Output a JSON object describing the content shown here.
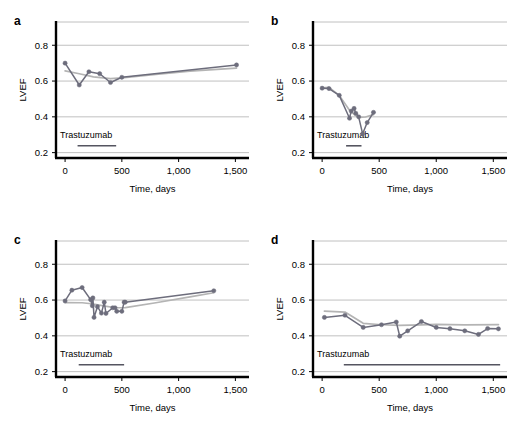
{
  "figure": {
    "panel_count": 4,
    "axis": {
      "ylabel": "LVEF",
      "xlabel": "Time, days",
      "yticks": [
        "0.2",
        "0.4",
        "0.6",
        "0.8"
      ],
      "ytick_values": [
        0.2,
        0.4,
        0.6,
        0.8
      ],
      "xticks": [
        "0",
        "500",
        "1,000",
        "1,500"
      ],
      "xtick_values": [
        0,
        500,
        1000,
        1500
      ],
      "ylim": [
        0.17,
        0.93
      ],
      "xlim": [
        -80,
        1620
      ]
    },
    "colors": {
      "observed_line": "#6d6d7c",
      "trend_line": "#b4b4b4",
      "gridline": "#b9b9b9",
      "spine": "#000000",
      "marker": "#6d6d7c",
      "text": "#000000"
    },
    "annotation_label": "Trastuzumab"
  },
  "chart_data": [
    {
      "type": "line",
      "panel": "a",
      "title": "",
      "xlabel": "Time, days",
      "ylabel": "LVEF",
      "xlim": [
        -80,
        1620
      ],
      "ylim": [
        0.17,
        0.93
      ],
      "grid": "horizontal",
      "legend": "none",
      "annotation": {
        "label": "Trastuzumab",
        "bar_start": 110,
        "bar_end": 450,
        "bar_y": 0.255
      },
      "series": [
        {
          "name": "Observed LVEF",
          "x": [
            0,
            125,
            210,
            305,
            400,
            500,
            1510
          ],
          "y": [
            0.7,
            0.578,
            0.652,
            0.641,
            0.592,
            0.621,
            0.69
          ]
        },
        {
          "name": "Smoothed trend",
          "x": [
            0,
            125,
            250,
            400,
            500,
            800,
            1100,
            1510
          ],
          "y": [
            0.657,
            0.641,
            0.623,
            0.614,
            0.618,
            0.637,
            0.655,
            0.672
          ]
        }
      ]
    },
    {
      "type": "line",
      "panel": "b",
      "title": "",
      "xlabel": "Time, days",
      "ylabel": "LVEF",
      "xlim": [
        -80,
        1620
      ],
      "ylim": [
        0.17,
        0.93
      ],
      "grid": "horizontal",
      "legend": "none",
      "annotation": {
        "label": "Trastuzumab",
        "bar_start": 210,
        "bar_end": 345,
        "bar_y": 0.255
      },
      "series": [
        {
          "name": "Observed LVEF",
          "x": [
            0,
            60,
            150,
            240,
            255,
            280,
            295,
            320,
            355,
            395,
            450
          ],
          "y": [
            0.56,
            0.558,
            0.52,
            0.392,
            0.432,
            0.447,
            0.42,
            0.4,
            0.305,
            0.368,
            0.425
          ]
        },
        {
          "name": "Smoothed trend",
          "x": [
            0,
            60,
            150,
            240,
            290,
            330,
            380,
            450
          ],
          "y": [
            0.562,
            0.565,
            0.52,
            0.437,
            0.408,
            0.397,
            0.399,
            0.412
          ]
        }
      ]
    },
    {
      "type": "line",
      "panel": "c",
      "title": "",
      "xlabel": "Time, days",
      "ylabel": "LVEF",
      "xlim": [
        -80,
        1620
      ],
      "ylim": [
        0.17,
        0.93
      ],
      "grid": "horizontal",
      "legend": "none",
      "annotation": {
        "label": "Trastuzumab",
        "bar_start": 120,
        "bar_end": 520,
        "bar_y": 0.255
      },
      "series": [
        {
          "name": "Observed LVEF",
          "x": [
            0,
            60,
            150,
            225,
            240,
            245,
            255,
            285,
            320,
            345,
            360,
            420,
            440,
            455,
            500,
            520,
            530,
            1310
          ],
          "y": [
            0.595,
            0.655,
            0.67,
            0.602,
            0.568,
            0.612,
            0.503,
            0.563,
            0.527,
            0.588,
            0.525,
            0.557,
            0.557,
            0.537,
            0.537,
            0.588,
            0.588,
            0.652
          ]
        },
        {
          "name": "Smoothed trend",
          "x": [
            0,
            150,
            250,
            350,
            450,
            530,
            800,
            1100,
            1310
          ],
          "y": [
            0.586,
            0.585,
            0.578,
            0.566,
            0.557,
            0.558,
            0.585,
            0.618,
            0.641
          ]
        }
      ]
    },
    {
      "type": "line",
      "panel": "d",
      "title": "",
      "xlabel": "Time, days",
      "ylabel": "LVEF",
      "xlim": [
        -80,
        1620
      ],
      "ylim": [
        0.17,
        0.93
      ],
      "grid": "horizontal",
      "legend": "none",
      "annotation": {
        "label": "Trastuzumab",
        "bar_start": 190,
        "bar_end": 1560,
        "bar_y": 0.255
      },
      "series": [
        {
          "name": "Observed LVEF",
          "x": [
            20,
            200,
            360,
            520,
            650,
            680,
            750,
            870,
            1000,
            1120,
            1250,
            1370,
            1450,
            1545
          ],
          "y": [
            0.503,
            0.515,
            0.447,
            0.462,
            0.477,
            0.398,
            0.428,
            0.48,
            0.447,
            0.44,
            0.428,
            0.408,
            0.441,
            0.439
          ]
        },
        {
          "name": "Smoothed trend",
          "x": [
            20,
            200,
            360,
            520,
            680,
            870,
            1000,
            1250,
            1545
          ],
          "y": [
            0.538,
            0.533,
            0.47,
            0.462,
            0.459,
            0.461,
            0.464,
            0.461,
            0.463
          ]
        }
      ]
    }
  ]
}
